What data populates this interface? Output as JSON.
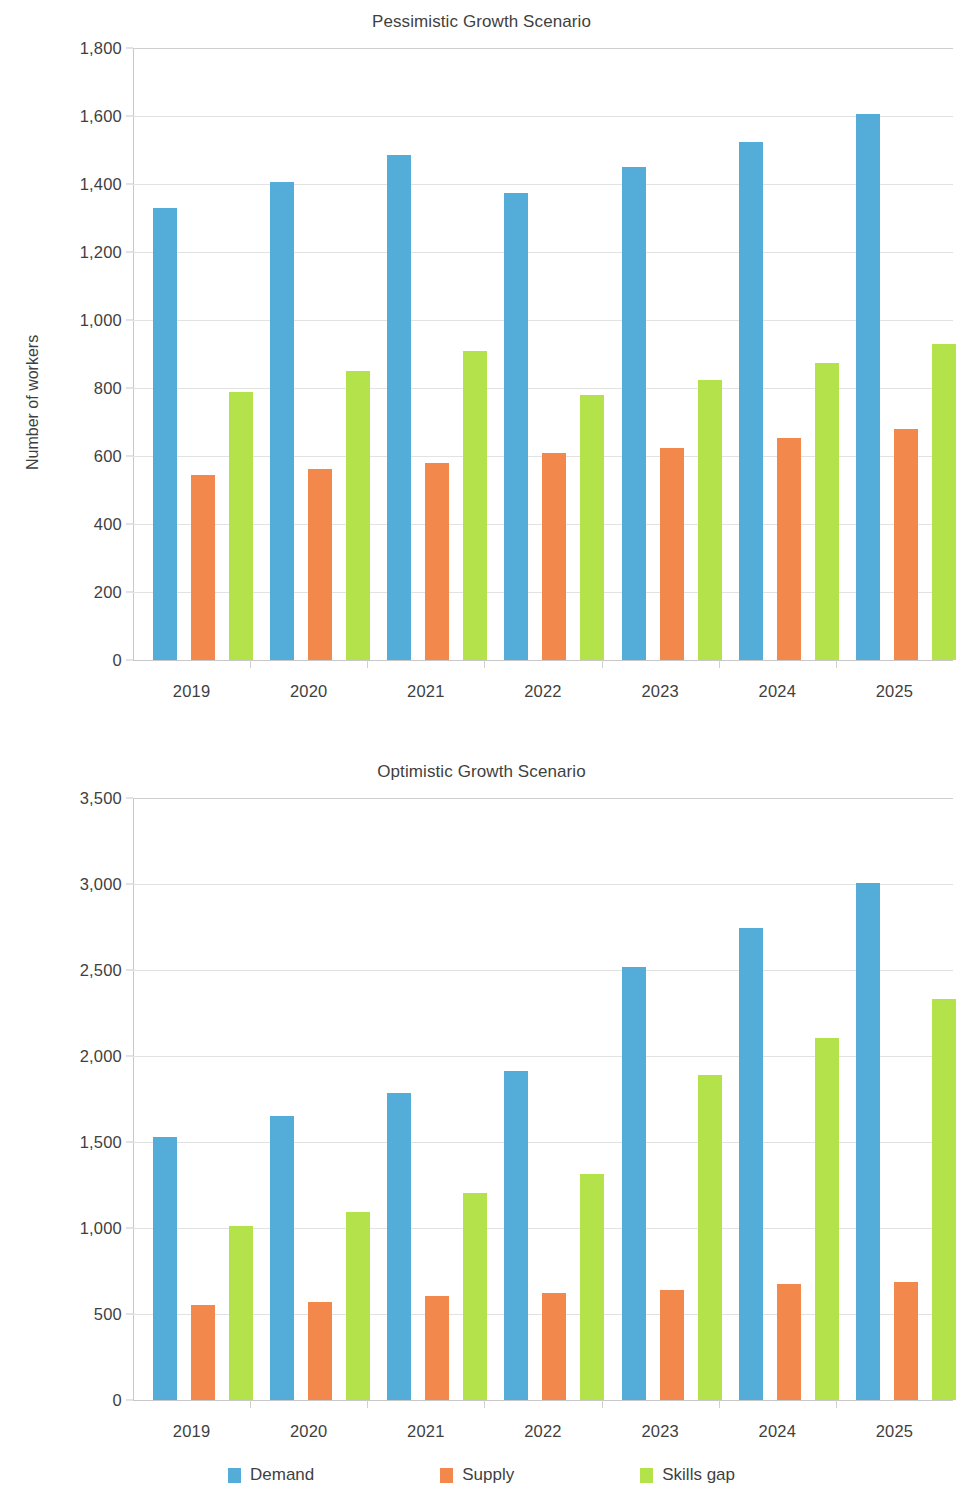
{
  "chart_data": [
    {
      "type": "bar",
      "title": "Pessimistic Growth Scenario",
      "xlabel": "",
      "ylabel": "Number of workers",
      "categories": [
        "2019",
        "2020",
        "2021",
        "2022",
        "2023",
        "2024",
        "2025"
      ],
      "ylim": [
        0,
        1800
      ],
      "yticks": [
        "0",
        "200",
        "400",
        "600",
        "800",
        "1,000",
        "1,200",
        "1,400",
        "1,600",
        "1,800"
      ],
      "ytick_values": [
        0,
        200,
        400,
        600,
        800,
        1000,
        1200,
        1400,
        1600,
        1800
      ],
      "grid": true,
      "legend_position": "bottom",
      "series": [
        {
          "name": "Demand",
          "color": "#54add8",
          "values": [
            1330,
            1405,
            1485,
            1375,
            1450,
            1525,
            1605
          ]
        },
        {
          "name": "Supply",
          "color": "#f2884b",
          "values": [
            545,
            562,
            580,
            608,
            625,
            653,
            680
          ]
        },
        {
          "name": "Skills gap",
          "color": "#b4e24a",
          "values": [
            788,
            850,
            910,
            780,
            825,
            875,
            930
          ]
        }
      ]
    },
    {
      "type": "bar",
      "title": "Optimistic Growth Scenario",
      "xlabel": "",
      "ylabel": "Number of workers",
      "categories": [
        "2019",
        "2020",
        "2021",
        "2022",
        "2023",
        "2024",
        "2025"
      ],
      "ylim": [
        0,
        3500
      ],
      "yticks": [
        "0",
        "500",
        "1,000",
        "1,500",
        "2,000",
        "2,500",
        "3,000",
        "3,500"
      ],
      "ytick_values": [
        0,
        500,
        1000,
        1500,
        2000,
        2500,
        3000,
        3500
      ],
      "grid": true,
      "legend_position": "bottom",
      "series": [
        {
          "name": "Demand",
          "color": "#54add8",
          "values": [
            1530,
            1650,
            1785,
            1915,
            2515,
            2745,
            3005
          ]
        },
        {
          "name": "Supply",
          "color": "#f2884b",
          "values": [
            555,
            568,
            605,
            625,
            638,
            675,
            688
          ]
        },
        {
          "name": "Skills gap",
          "color": "#b4e24a",
          "values": [
            1010,
            1095,
            1205,
            1315,
            1890,
            2105,
            2330
          ]
        }
      ]
    }
  ],
  "legend": {
    "items": [
      {
        "label": "Demand",
        "color": "#54add8"
      },
      {
        "label": "Supply",
        "color": "#f2884b"
      },
      {
        "label": "Skills gap",
        "color": "#b4e24a"
      }
    ]
  }
}
